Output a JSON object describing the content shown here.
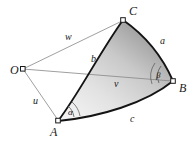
{
  "figure": {
    "background_color": "#ffffff",
    "line_color": "#808080",
    "arc_color": "#111111",
    "fill_light": "#e8e8e8",
    "fill_dark": "#8f8f8f",
    "label_color": "#1a1a1a"
  },
  "vertices": [
    {
      "id": "O",
      "label": "O",
      "x": 23,
      "y": 69,
      "label_x": 10,
      "label_y": 64,
      "marker": "open-square"
    },
    {
      "id": "A",
      "label": "A",
      "x": 58,
      "y": 121,
      "label_x": 50,
      "label_y": 126,
      "marker": "open-square"
    },
    {
      "id": "B",
      "label": "B",
      "x": 173,
      "y": 81,
      "label_x": 179,
      "label_y": 82,
      "marker": "open-square"
    },
    {
      "id": "C",
      "label": "C",
      "x": 123,
      "y": 20,
      "label_x": 129,
      "label_y": 5,
      "marker": "open-square"
    }
  ],
  "radii": [
    {
      "id": "u",
      "label": "u",
      "from": "O",
      "to": "A",
      "label_x": 33,
      "label_y": 96
    },
    {
      "id": "v",
      "label": "v",
      "from": "O",
      "to": "B",
      "label_x": 114,
      "label_y": 79
    },
    {
      "id": "w",
      "label": "w",
      "from": "O",
      "to": "C",
      "label_x": 65,
      "label_y": 32
    }
  ],
  "arcs": [
    {
      "id": "a",
      "label": "a",
      "from": "C",
      "to": "B",
      "label_x": 160,
      "label_y": 36
    },
    {
      "id": "b",
      "label": "b",
      "from": "A",
      "to": "C",
      "label_x": 91,
      "label_y": 54
    },
    {
      "id": "c",
      "label": "c",
      "from": "A",
      "to": "B",
      "label_x": 130,
      "label_y": 114
    }
  ],
  "angles": [
    {
      "id": "alpha",
      "label": "α",
      "at": "A",
      "label_x": 68,
      "label_y": 108
    },
    {
      "id": "beta",
      "label": "β",
      "at": "B",
      "label_x": 156,
      "label_y": 71
    }
  ]
}
